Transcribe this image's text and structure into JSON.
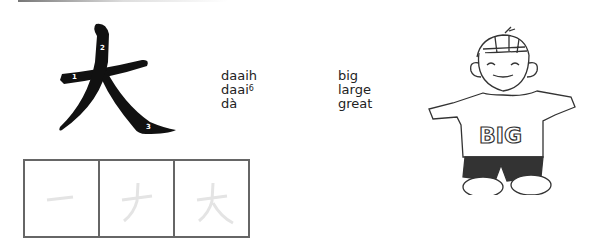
{
  "character": {
    "glyph": "大",
    "stroke_numbers": [
      "1",
      "2",
      "3"
    ]
  },
  "readings": [
    {
      "romanization": "daaih",
      "superscript": "",
      "meaning": "big"
    },
    {
      "romanization": "daai",
      "superscript": "6",
      "meaning": "large"
    },
    {
      "romanization": "dà",
      "superscript": "",
      "meaning": "great"
    }
  ],
  "stroke_order_boxes": [
    {
      "step": 1,
      "stroke": "一"
    },
    {
      "step": 2,
      "stroke": "ナ"
    },
    {
      "step": 3,
      "stroke": "大"
    }
  ],
  "illustration": {
    "shirt_text": "BIG"
  }
}
